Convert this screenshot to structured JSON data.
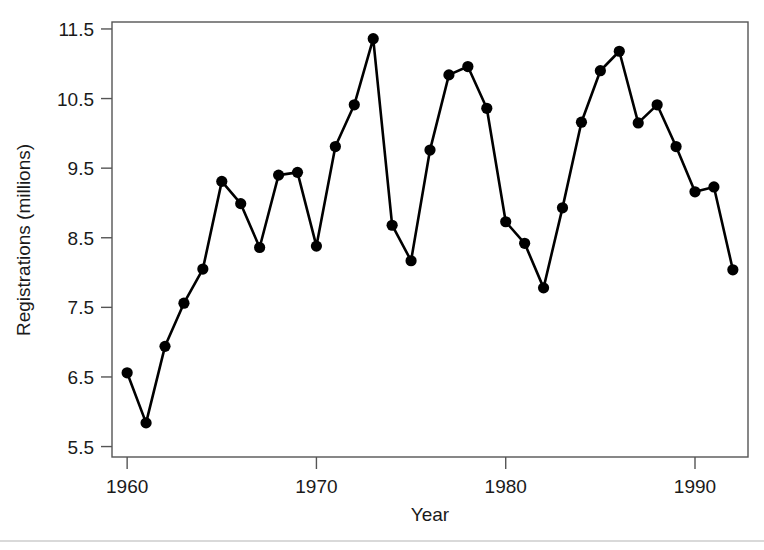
{
  "chart_data": {
    "type": "line",
    "title": "",
    "xlabel": "Year",
    "ylabel": "Registrations (millions)",
    "xlim": [
      1959.2,
      1992.8
    ],
    "ylim": [
      5.35,
      11.6
    ],
    "grid": false,
    "legend": "none",
    "marker": "filled-circle",
    "line_color": "#000000",
    "xticks": [
      1960,
      1970,
      1980,
      1990
    ],
    "xtick_labels": [
      "1960",
      "1970",
      "1980",
      "1990"
    ],
    "yticks": [
      5.5,
      6.5,
      7.5,
      8.5,
      9.5,
      10.5,
      11.5
    ],
    "ytick_labels": [
      "5.5",
      "6.5",
      "7.5",
      "8.5",
      "9.5",
      "10.5",
      "11.5"
    ],
    "x": [
      1960,
      1961,
      1962,
      1963,
      1964,
      1965,
      1966,
      1967,
      1968,
      1969,
      1970,
      1971,
      1972,
      1973,
      1974,
      1975,
      1976,
      1977,
      1978,
      1979,
      1980,
      1981,
      1982,
      1983,
      1984,
      1985,
      1986,
      1987,
      1988,
      1989,
      1990,
      1991,
      1992
    ],
    "y": [
      6.56,
      5.84,
      6.94,
      7.56,
      8.05,
      9.31,
      8.99,
      8.36,
      9.4,
      9.44,
      8.38,
      9.81,
      10.41,
      11.36,
      8.68,
      8.17,
      9.76,
      10.84,
      10.96,
      10.36,
      8.73,
      8.42,
      7.78,
      8.93,
      10.16,
      10.9,
      11.18,
      10.15,
      10.41,
      9.81,
      9.16,
      9.23,
      8.04
    ],
    "series_name": "Registrations"
  },
  "axis": {
    "y_title": "Registrations (millions)",
    "x_title": "Year"
  }
}
